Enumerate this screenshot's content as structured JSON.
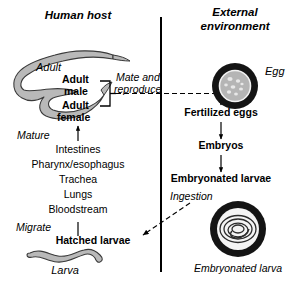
{
  "headers": {
    "left": "Human host",
    "right_line1": "External",
    "right_line2": "environment"
  },
  "left_panel": {
    "adult_worm_label": "Adult",
    "adult_male": "Adult\nmale",
    "adult_male_line1": "Adult",
    "adult_male_line2": "male",
    "adult_female_line1": "Adult",
    "adult_female_line2": "female",
    "mate_label_line1": "Mate and",
    "mate_label_line2": "reproduce",
    "mature_label": "Mature",
    "migration_steps": [
      "Intestines",
      "Pharynx/esophagus",
      "Trachea",
      "Lungs",
      "Bloodstream"
    ],
    "migrate_label": "Migrate",
    "hatched_larvae": "Hatched larvae",
    "larva_label": "Larva"
  },
  "right_panel": {
    "egg_label": "Egg",
    "stages": [
      "Fertilized eggs",
      "Embryos",
      "Embryonated larvae"
    ],
    "ingestion_label": "Ingestion",
    "embryonated_larva_label": "Embryonated larva"
  },
  "colors": {
    "worm_fill": "#b9b9b9",
    "worm_stroke": "#3a3a3a",
    "egg_ring": "#141414",
    "egg_inner": "#b5b5b5",
    "line": "#000000",
    "background": "#ffffff"
  },
  "icons": {
    "adult_worm": "hooked-worm-shape",
    "larva": "wavy-larva-shape",
    "egg": "egg-circle",
    "embryonated_larva": "coiled-larva-circle"
  }
}
